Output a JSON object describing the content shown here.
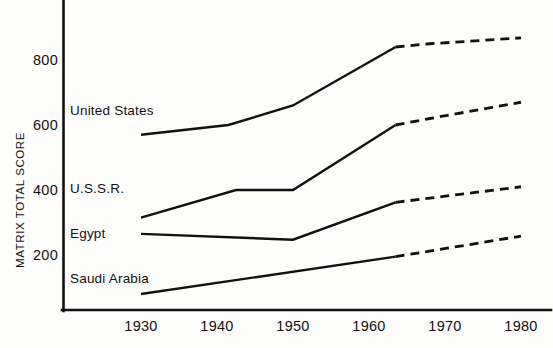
{
  "chart_data": {
    "type": "line",
    "title": "",
    "subtitle": "",
    "xlabel": "",
    "ylabel": "MATRIX TOTAL SCORE",
    "xlim": [
      1928,
      1981
    ],
    "ylim": [
      50,
      900
    ],
    "grid": false,
    "legend_position": "inline-left",
    "x_ticks": [
      1930,
      1940,
      1950,
      1960,
      1970,
      1980
    ],
    "x_tick_labels": [
      "1930",
      "1940",
      "1950",
      "1960",
      "1970",
      "1980"
    ],
    "y_ticks": [
      200,
      400,
      600,
      800
    ],
    "y_tick_labels": [
      "200",
      "400",
      "600",
      "800"
    ],
    "annotations": [
      "Solid segments denote historical data; dashed segments denote projections after about 1963."
    ],
    "series": [
      {
        "name": "United States",
        "label": "United States",
        "solid_x": [
          1930,
          1941.5,
          1950,
          1963.5
        ],
        "solid_y": [
          570,
          600,
          660,
          840
        ],
        "dashed_x": [
          1963.5,
          1968,
          1980
        ],
        "dashed_y": [
          840,
          850,
          868
        ],
        "color": "#111111"
      },
      {
        "name": "U.S.S.R.",
        "label": "U.S.S.R.",
        "solid_x": [
          1930,
          1942.5,
          1950,
          1963.5
        ],
        "solid_y": [
          315,
          400,
          400,
          600
        ],
        "dashed_x": [
          1963.5,
          1968,
          1980
        ],
        "dashed_y": [
          600,
          620,
          670
        ],
        "color": "#111111"
      },
      {
        "name": "Egypt",
        "label": "Egypt",
        "solid_x": [
          1930,
          1950,
          1963.5
        ],
        "solid_y": [
          265,
          247,
          362
        ],
        "dashed_x": [
          1963.5,
          1980
        ],
        "dashed_y": [
          362,
          410
        ],
        "color": "#111111"
      },
      {
        "name": "Saudi Arabia",
        "label": "Saudi Arabia",
        "solid_x": [
          1930,
          1963.5
        ],
        "solid_y": [
          80,
          195
        ],
        "dashed_x": [
          1963.5,
          1980
        ],
        "dashed_y": [
          195,
          258
        ],
        "color": "#111111"
      }
    ]
  },
  "axes": {
    "y_title": "MATRIX TOTAL SCORE",
    "y_ticks": [
      "800",
      "600",
      "400",
      "200"
    ],
    "x_ticks": [
      "1930",
      "1940",
      "1950",
      "1960",
      "1970",
      "1980"
    ]
  },
  "series_labels": {
    "united_states": "United States",
    "ussr": "U.S.S.R.",
    "egypt": "Egypt",
    "saudi_arabia": "Saudi Arabia"
  },
  "style": {
    "line_color": "#111111",
    "axis_color": "#111111",
    "background": "#fdfdfc"
  }
}
